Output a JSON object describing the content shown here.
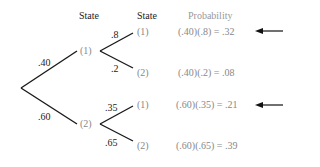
{
  "headers": {
    "state1": "State",
    "state2": "State",
    "probability": "Probability"
  },
  "root_branches": [
    {
      "label": ".40",
      "to_state": "(1)"
    },
    {
      "label": ".60",
      "to_state": "(2)"
    }
  ],
  "second_stage": [
    {
      "from": "(1)",
      "branches": [
        {
          "label": ".8",
          "state": "(1)",
          "calc": "(.40)(.8) = .32",
          "arrow": true
        },
        {
          "label": ".2",
          "state": "(2)",
          "calc": "(.40)(.2) = .08",
          "arrow": false
        }
      ]
    },
    {
      "from": "(2)",
      "branches": [
        {
          "label": ".35",
          "state": "(1)",
          "calc": "(.60)(.35) = .21",
          "arrow": true
        },
        {
          "label": ".65",
          "state": "(2)",
          "calc": "(.60)(.65) = .39",
          "arrow": false
        }
      ]
    }
  ],
  "colors": {
    "line": "#1a1a1a",
    "node_text": "#888888",
    "header": "#222222"
  }
}
